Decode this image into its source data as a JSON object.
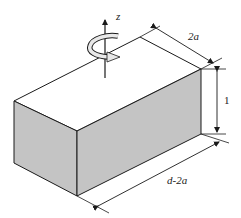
{
  "figure": {
    "type": "isometric-block",
    "colors": {
      "face_fill": "#c4c4c4",
      "top_fill": "#ffffff",
      "stroke": "#1a1a1a",
      "arrow_fill": "#e8e8e8"
    }
  },
  "labels": {
    "axis": "z",
    "width": "2a",
    "height": "1",
    "length": "d-2a"
  }
}
